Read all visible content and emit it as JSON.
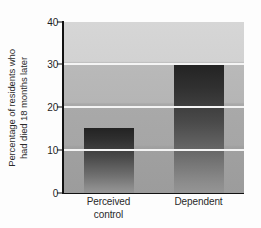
{
  "chart_data": {
    "type": "bar",
    "title": "",
    "subtitle": "",
    "xlabel": "",
    "ylabel_lines": [
      "Percentage of residents who",
      "had died 18 months later"
    ],
    "ylabel": "Percentage of residents who had died 18 months later",
    "categories": [
      "Perceived control",
      "Dependent"
    ],
    "category_lines": [
      [
        "Perceived",
        "control"
      ],
      [
        "Dependent"
      ]
    ],
    "values": [
      15,
      30
    ],
    "ylim": [
      0,
      40
    ],
    "yticks": [
      0,
      10,
      20,
      30,
      40
    ],
    "ytick_labels": [
      "0",
      "10",
      "20",
      "30",
      "40"
    ],
    "gridlines_at": [
      10,
      20,
      30
    ],
    "grid": true,
    "legend": false,
    "legend_position": "none",
    "bar_color_top": "#232323",
    "bar_color_bottom": "#959595",
    "plot_background_top": "#d6d6d6",
    "plot_background_bottom": "#9c9c9c",
    "gridline_color": "#f4f4f4",
    "axis_color": "#111111",
    "text_color": "#2a2a2a"
  }
}
